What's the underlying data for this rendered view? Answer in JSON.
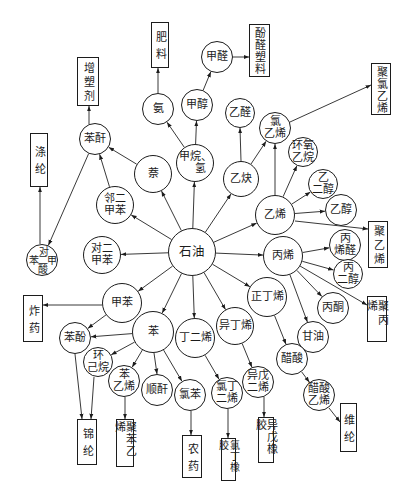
{
  "nodes": {
    "petroleum": {
      "lines": [
        "石油"
      ]
    },
    "naphthalene": {
      "lines": [
        "萘"
      ]
    },
    "methane_hydrogen": {
      "lines": [
        "甲烷、",
        "氢"
      ]
    },
    "ammonia": {
      "lines": [
        "氨"
      ]
    },
    "methanol": {
      "lines": [
        "甲醇"
      ]
    },
    "formaldehyde": {
      "lines": [
        "甲醛"
      ]
    },
    "acetaldehyde": {
      "lines": [
        "乙醛"
      ]
    },
    "acetylene": {
      "lines": [
        "乙炔"
      ]
    },
    "vinyl_chloride": {
      "lines": [
        "氯",
        "乙烯"
      ]
    },
    "ethylene_oxide": {
      "lines": [
        "环氧",
        "乙烷"
      ]
    },
    "ethylene": {
      "lines": [
        "乙烯"
      ]
    },
    "ethylene_glycol": {
      "lines": [
        "乙",
        "二醇"
      ]
    },
    "ethanol": {
      "lines": [
        "乙醇"
      ]
    },
    "propylene": {
      "lines": [
        "丙烯"
      ]
    },
    "acrolein": {
      "lines": [
        "丙",
        "烯醛"
      ]
    },
    "propylene_glycol": {
      "lines": [
        "丙",
        "二醇"
      ]
    },
    "acetone": {
      "lines": [
        "丙酮"
      ]
    },
    "glycerol": {
      "lines": [
        "甘油"
      ]
    },
    "n_butene": {
      "lines": [
        "正丁烯"
      ]
    },
    "acetic_acid": {
      "lines": [
        "醋酸"
      ]
    },
    "vinyl_acetate": {
      "lines": [
        "醋酸",
        "乙烯"
      ]
    },
    "isobutylene": {
      "lines": [
        "异丁烯"
      ]
    },
    "isoprene": {
      "lines": [
        "异戊",
        "二烯"
      ]
    },
    "butadiene": {
      "lines": [
        "丁二烯"
      ]
    },
    "chloroprene": {
      "lines": [
        "氯丁",
        "二烯"
      ]
    },
    "benzene": {
      "lines": [
        "苯"
      ]
    },
    "chlorobenzene": {
      "lines": [
        "氯苯"
      ]
    },
    "maleic_anhydride": {
      "lines": [
        "顺酐"
      ]
    },
    "styrene": {
      "lines": [
        "苯",
        "乙烯"
      ]
    },
    "cyclohexane": {
      "lines": [
        "环",
        "己烷"
      ]
    },
    "phenol": {
      "lines": [
        "苯酚"
      ]
    },
    "toluene": {
      "lines": [
        "甲苯"
      ]
    },
    "p_xylene": {
      "lines": [
        "对二",
        "甲苯"
      ]
    },
    "o_xylene": {
      "lines": [
        "邻二",
        "甲苯"
      ]
    },
    "phthalic_anhydride": {
      "lines": [
        "苯酐"
      ]
    },
    "terephthalic_acid": {
      "top": "对",
      "left": "苯",
      "center": "二",
      "right": "甲",
      "bottom": "酸"
    }
  },
  "products": {
    "fertilizer": "肥料",
    "phenolic_plastic": "酚醛塑料",
    "plasticizer": "增塑剂",
    "polyester_fiber": "涤纶",
    "pvc": "聚氯乙烯",
    "polyethylene": "聚乙烯",
    "polypropylene": "聚丙烯",
    "vinylon": "维纶",
    "isoprene_rubber": "异戊橡胶",
    "chloroprene_rubber": "氯丁橡胶",
    "pesticide": "农药",
    "polystyrene": "聚苯乙烯",
    "nylon": "锦纶",
    "explosives": "炸药"
  },
  "edges": [
    {
      "from": "石油",
      "to": "萘"
    },
    {
      "from": "石油",
      "to": "甲烷、氢"
    },
    {
      "from": "石油",
      "to": "乙炔"
    },
    {
      "from": "石油",
      "to": "乙烯"
    },
    {
      "from": "石油",
      "to": "丙烯"
    },
    {
      "from": "石油",
      "to": "正丁烯"
    },
    {
      "from": "石油",
      "to": "异丁烯"
    },
    {
      "from": "石油",
      "to": "丁二烯"
    },
    {
      "from": "石油",
      "to": "苯"
    },
    {
      "from": "石油",
      "to": "甲苯"
    },
    {
      "from": "石油",
      "to": "对二甲苯"
    },
    {
      "from": "石油",
      "to": "邻二甲苯"
    },
    {
      "from": "萘",
      "to": "苯酐"
    },
    {
      "from": "邻二甲苯",
      "to": "苯酐"
    },
    {
      "from": "苯酐",
      "to": "增塑剂"
    },
    {
      "from": "苯酐",
      "to": "对苯二甲酸"
    },
    {
      "from": "对苯二甲酸",
      "to": "涤纶"
    },
    {
      "from": "甲烷、氢",
      "to": "氨"
    },
    {
      "from": "甲烷、氢",
      "to": "甲醇"
    },
    {
      "from": "氨",
      "to": "肥料"
    },
    {
      "from": "甲醇",
      "to": "甲醛"
    },
    {
      "from": "甲醛",
      "to": "酚醛塑料"
    },
    {
      "from": "乙炔",
      "to": "乙醛"
    },
    {
      "from": "乙炔",
      "to": "氯乙烯"
    },
    {
      "from": "乙烯",
      "to": "氯乙烯"
    },
    {
      "from": "氯乙烯",
      "to": "聚氯乙烯"
    },
    {
      "from": "乙烯",
      "to": "环氧乙烷"
    },
    {
      "from": "乙烯",
      "to": "乙二醇"
    },
    {
      "from": "乙烯",
      "to": "乙醇"
    },
    {
      "from": "乙烯",
      "to": "聚乙烯"
    },
    {
      "from": "丙烯",
      "to": "丙烯醛"
    },
    {
      "from": "丙烯",
      "to": "丙二醇"
    },
    {
      "from": "丙烯",
      "to": "聚丙烯"
    },
    {
      "from": "丙烯",
      "to": "丙酮"
    },
    {
      "from": "丙烯",
      "to": "甘油"
    },
    {
      "from": "正丁烯",
      "to": "醋酸"
    },
    {
      "from": "醋酸",
      "to": "醋酸乙烯"
    },
    {
      "from": "醋酸乙烯",
      "to": "维纶"
    },
    {
      "from": "异丁烯",
      "to": "异戊二烯"
    },
    {
      "from": "异戊二烯",
      "to": "异戊橡胶"
    },
    {
      "from": "丁二烯",
      "to": "氯丁二烯"
    },
    {
      "from": "氯丁二烯",
      "to": "氯丁橡胶"
    },
    {
      "from": "苯",
      "to": "苯酚"
    },
    {
      "from": "苯",
      "to": "环己烷"
    },
    {
      "from": "苯",
      "to": "苯乙烯"
    },
    {
      "from": "苯",
      "to": "顺酐"
    },
    {
      "from": "苯",
      "to": "氯苯"
    },
    {
      "from": "甲苯",
      "to": "苯酚"
    },
    {
      "from": "甲苯",
      "to": "炸药"
    },
    {
      "from": "苯酚",
      "to": "锦纶"
    },
    {
      "from": "环己烷",
      "to": "锦纶"
    },
    {
      "from": "苯乙烯",
      "to": "聚苯乙烯"
    },
    {
      "from": "氯苯",
      "to": "农药"
    }
  ]
}
